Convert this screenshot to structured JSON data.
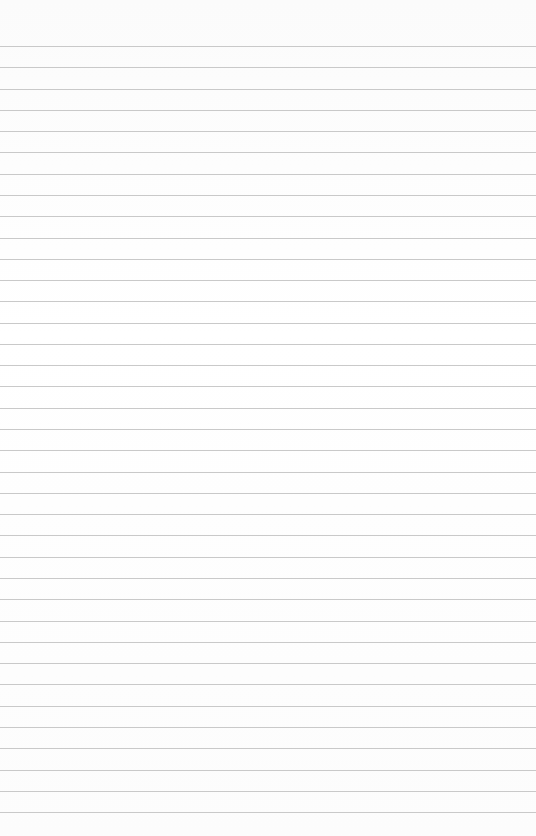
{
  "page": {
    "type": "blank-lined-paper",
    "background_color": "#fdfdfd",
    "line_color": "#c9c9c9",
    "first_line_y": 46,
    "line_spacing": 21.28,
    "line_count": 37
  }
}
